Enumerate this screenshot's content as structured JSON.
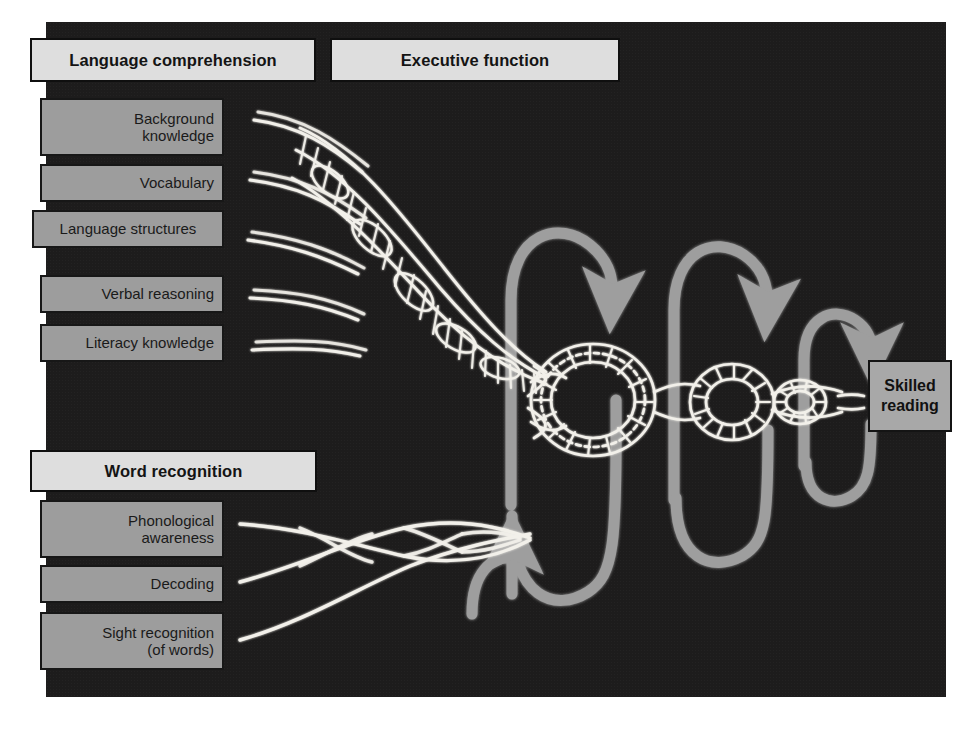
{
  "figure": {
    "name": "reading-rope-diagram",
    "panel_background": "#1d1c1c",
    "rope_color": "#f2f0ea",
    "arrow_color": "#9e9e9e"
  },
  "sections": {
    "language_comprehension": {
      "title": "Language comprehension",
      "strands": [
        {
          "id": "background-knowledge",
          "lines": [
            "Background",
            "knowledge"
          ]
        },
        {
          "id": "vocabulary",
          "lines": [
            "Vocabulary"
          ]
        },
        {
          "id": "language-structures",
          "lines": [
            "Language structures"
          ]
        },
        {
          "id": "verbal-reasoning",
          "lines": [
            "Verbal reasoning"
          ]
        },
        {
          "id": "literacy-knowledge",
          "lines": [
            "Literacy knowledge"
          ]
        }
      ]
    },
    "executive_function": {
      "title": "Executive function"
    },
    "word_recognition": {
      "title": "Word recognition",
      "strands": [
        {
          "id": "phonological-awareness",
          "lines": [
            "Phonological",
            "awareness"
          ]
        },
        {
          "id": "decoding",
          "lines": [
            "Decoding"
          ]
        },
        {
          "id": "sight-recognition",
          "lines": [
            "Sight recognition",
            "(of words)"
          ]
        }
      ]
    }
  },
  "outcome": {
    "id": "skilled-reading",
    "lines": [
      "Skilled",
      "reading"
    ]
  }
}
